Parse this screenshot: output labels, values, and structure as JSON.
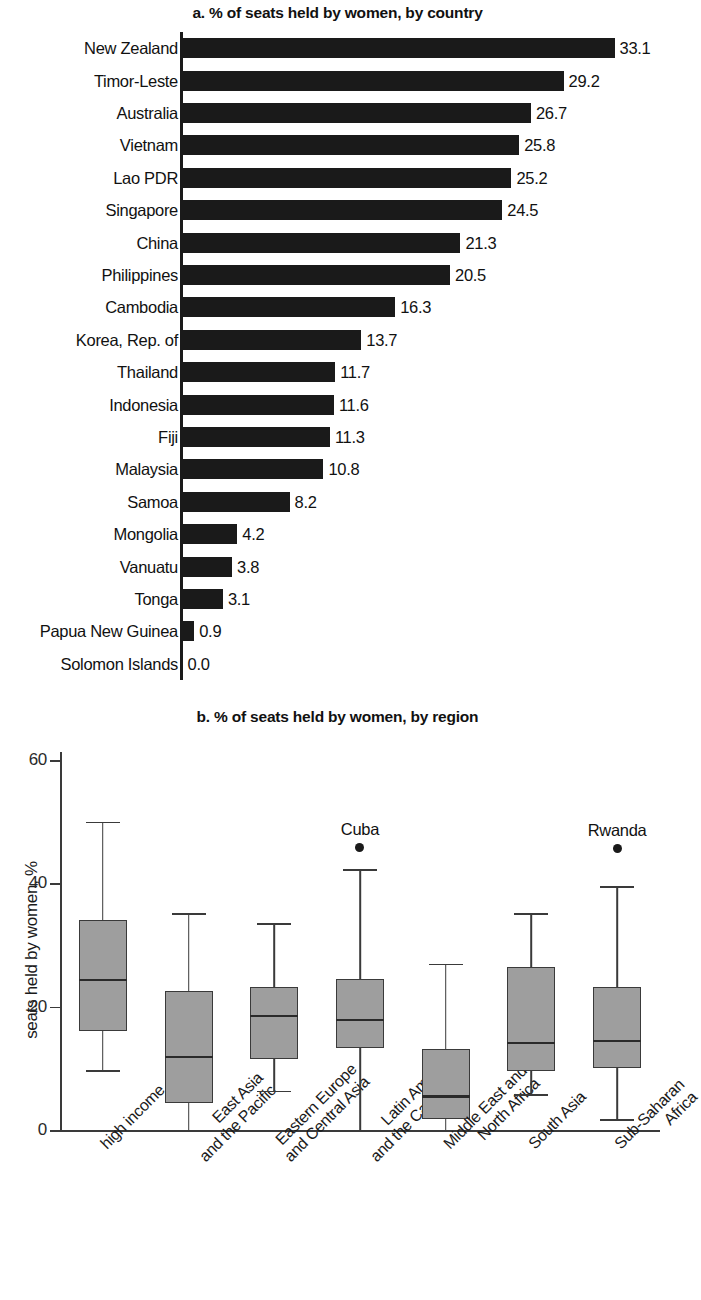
{
  "figure": {
    "panel_a_title": "a. % of seats held by women, by country",
    "panel_b_title": "b. % of seats held by women, by region"
  },
  "chart_data": [
    {
      "type": "bar",
      "title": "a. % of seats held by women, by country",
      "orientation": "horizontal",
      "xlabel": "",
      "ylabel": "",
      "xlim": [
        0,
        33.1
      ],
      "grid": false,
      "legend": "none",
      "value_labels": true,
      "categories": [
        "New Zealand",
        "Timor-Leste",
        "Australia",
        "Vietnam",
        "Lao PDR",
        "Singapore",
        "China",
        "Philippines",
        "Cambodia",
        "Korea, Rep. of",
        "Thailand",
        "Indonesia",
        "Fiji",
        "Malaysia",
        "Samoa",
        "Mongolia",
        "Vanuatu",
        "Tonga",
        "Papua New Guinea",
        "Solomon Islands"
      ],
      "values": [
        33.1,
        29.2,
        26.7,
        25.8,
        25.2,
        24.5,
        21.3,
        20.5,
        16.3,
        13.7,
        11.7,
        11.6,
        11.3,
        10.8,
        8.2,
        4.2,
        3.8,
        3.1,
        0.9,
        0.0
      ],
      "value_label_text": [
        "33.1",
        "29.2",
        "26.7",
        "25.8",
        "25.2",
        "24.5",
        "21.3",
        "20.5",
        "16.3",
        "13.7",
        "11.7",
        "11.6",
        "11.3",
        "10.8",
        "8.2",
        "4.2",
        "3.8",
        "3.1",
        "0.9",
        "0.0"
      ]
    },
    {
      "type": "box",
      "title": "b. % of seats held by women, by region",
      "xlabel": "",
      "ylabel": "seats held by women, %",
      "ylim": [
        0,
        60
      ],
      "yticks": [
        0,
        20,
        40,
        60
      ],
      "ytick_labels": [
        "0",
        "20",
        "40",
        "60"
      ],
      "grid": false,
      "legend": "none",
      "categories": [
        "high income",
        "East Asia and the Pacific",
        "Eastern Europe and Central Asia",
        "Latin America and the Caribbean",
        "Middle East and North Africa",
        "South Asia",
        "Sub-Saharan Africa"
      ],
      "category_lines": [
        [
          "high income",
          ""
        ],
        [
          "East Asia",
          "and the Pacific"
        ],
        [
          "Eastern Europe",
          "and Central Asia"
        ],
        [
          "Latin America",
          "and the Caribbean"
        ],
        [
          "Middle East and",
          "North Africa"
        ],
        [
          "South Asia",
          ""
        ],
        [
          "Sub-Saharan",
          "Africa"
        ]
      ],
      "boxes": [
        {
          "name": "high income",
          "min": 9.7,
          "q1": 16.0,
          "median": 24.5,
          "q3": 34.0,
          "max": 50.0,
          "outliers": []
        },
        {
          "name": "East Asia and the Pacific",
          "min": 0.0,
          "q1": 4.3,
          "median": 12.0,
          "q3": 22.5,
          "max": 35.2,
          "outliers": []
        },
        {
          "name": "Eastern Europe and Central Asia",
          "min": 6.4,
          "q1": 11.5,
          "median": 18.7,
          "q3": 23.2,
          "max": 33.6,
          "outliers": []
        },
        {
          "name": "Latin America and the Caribbean",
          "min": 0.0,
          "q1": 13.3,
          "median": 18.0,
          "q3": 24.5,
          "max": 42.3,
          "outliers": [
            45.8
          ]
        },
        {
          "name": "Middle East and North Africa",
          "min": 0.0,
          "q1": 1.8,
          "median": 5.6,
          "q3": 13.2,
          "max": 27.0,
          "outliers": []
        },
        {
          "name": "South Asia",
          "min": 5.8,
          "q1": 9.6,
          "median": 14.3,
          "q3": 26.5,
          "max": 35.2,
          "outliers": []
        },
        {
          "name": "Sub-Saharan Africa",
          "min": 1.8,
          "q1": 10.1,
          "median": 14.6,
          "q3": 23.2,
          "max": 39.5,
          "outliers": [
            45.6
          ]
        }
      ],
      "annotations": [
        {
          "text": "Cuba",
          "category": "Latin America and the Caribbean",
          "value": 45.8
        },
        {
          "text": "Rwanda",
          "category": "Sub-Saharan Africa",
          "value": 45.6
        }
      ]
    }
  ],
  "colors": {
    "ink": "#1a1a1a",
    "bar_fill": "#1a1a1a",
    "box_fill": "#9e9e9e",
    "box_stroke": "#3a3a3a",
    "background": "#ffffff"
  }
}
